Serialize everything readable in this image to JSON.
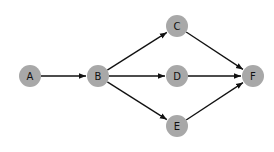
{
  "diagram": {
    "type": "directed-graph",
    "node_color": "#a8a8a8",
    "edge_color": "#111111",
    "node_radius": 11,
    "nodes": [
      {
        "id": "A",
        "label": "A",
        "x": 30,
        "y": 76
      },
      {
        "id": "B",
        "label": "B",
        "x": 98,
        "y": 76
      },
      {
        "id": "C",
        "label": "C",
        "x": 177,
        "y": 26
      },
      {
        "id": "D",
        "label": "D",
        "x": 177,
        "y": 76
      },
      {
        "id": "E",
        "label": "E",
        "x": 177,
        "y": 126
      },
      {
        "id": "F",
        "label": "F",
        "x": 253,
        "y": 76
      }
    ],
    "edges": [
      {
        "from": "A",
        "to": "B"
      },
      {
        "from": "B",
        "to": "C"
      },
      {
        "from": "B",
        "to": "D"
      },
      {
        "from": "B",
        "to": "E"
      },
      {
        "from": "C",
        "to": "F"
      },
      {
        "from": "D",
        "to": "F"
      },
      {
        "from": "E",
        "to": "F"
      }
    ]
  }
}
